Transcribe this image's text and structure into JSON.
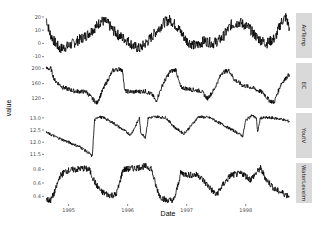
{
  "chart_data": {
    "type": "line",
    "title": "",
    "xlabel": "Date",
    "ylabel": "value",
    "x_range": [
      1994.6,
      1998.75
    ],
    "x_ticks": [
      {
        "value": 1995,
        "label": "1995"
      },
      {
        "value": 1996,
        "label": "1996"
      },
      {
        "value": 1997,
        "label": "1997"
      },
      {
        "value": 1998,
        "label": "1998"
      }
    ],
    "grid": false,
    "facets": [
      {
        "name": "AirTemp",
        "strip_label": "AirTemp",
        "ylim": [
          -11,
          23
        ],
        "y_ticks": [
          {
            "value": 20,
            "label": "20"
          },
          {
            "value": 10,
            "label": "10"
          },
          {
            "value": 0,
            "label": "0"
          },
          {
            "value": -10,
            "label": "-10"
          }
        ],
        "noise": 4,
        "points": [
          [
            1994.62,
            19
          ],
          [
            1994.68,
            8
          ],
          [
            1994.75,
            2
          ],
          [
            1994.85,
            -4
          ],
          [
            1995.0,
            -2
          ],
          [
            1995.15,
            2
          ],
          [
            1995.3,
            6
          ],
          [
            1995.45,
            12
          ],
          [
            1995.55,
            17
          ],
          [
            1995.65,
            16
          ],
          [
            1995.75,
            10
          ],
          [
            1995.85,
            6
          ],
          [
            1996.0,
            2
          ],
          [
            1996.1,
            -2
          ],
          [
            1996.2,
            -4
          ],
          [
            1996.35,
            2
          ],
          [
            1996.5,
            10
          ],
          [
            1996.62,
            16
          ],
          [
            1996.72,
            18
          ],
          [
            1996.85,
            12
          ],
          [
            1997.0,
            2
          ],
          [
            1997.15,
            -2
          ],
          [
            1997.3,
            2
          ],
          [
            1997.45,
            0
          ],
          [
            1997.6,
            4
          ],
          [
            1997.75,
            14
          ],
          [
            1997.9,
            16
          ],
          [
            1998.05,
            12
          ],
          [
            1998.2,
            4
          ],
          [
            1998.35,
            0
          ],
          [
            1998.5,
            4
          ],
          [
            1998.6,
            16
          ],
          [
            1998.68,
            20
          ],
          [
            1998.74,
            12
          ]
        ]
      },
      {
        "name": "EC",
        "strip_label": "EC",
        "ylim": [
          95,
          215
        ],
        "y_ticks": [
          {
            "value": 200,
            "label": "200"
          },
          {
            "value": 160,
            "label": "160"
          },
          {
            "value": 120,
            "label": "120"
          }
        ],
        "noise": 6,
        "points": [
          [
            1994.62,
            200
          ],
          [
            1994.7,
            200
          ],
          [
            1994.76,
            170
          ],
          [
            1994.9,
            150
          ],
          [
            1995.1,
            140
          ],
          [
            1995.3,
            138
          ],
          [
            1995.4,
            120
          ],
          [
            1995.48,
            108
          ],
          [
            1995.6,
            150
          ],
          [
            1995.75,
            195
          ],
          [
            1995.88,
            200
          ],
          [
            1995.92,
            190
          ],
          [
            1995.95,
            140
          ],
          [
            1996.1,
            138
          ],
          [
            1996.3,
            140
          ],
          [
            1996.42,
            130
          ],
          [
            1996.48,
            112
          ],
          [
            1996.6,
            160
          ],
          [
            1996.72,
            192
          ],
          [
            1996.82,
            198
          ],
          [
            1996.85,
            175
          ],
          [
            1996.9,
            150
          ],
          [
            1997.05,
            145
          ],
          [
            1997.25,
            140
          ],
          [
            1997.35,
            120
          ],
          [
            1997.45,
            140
          ],
          [
            1997.6,
            190
          ],
          [
            1997.72,
            195
          ],
          [
            1997.8,
            172
          ],
          [
            1997.95,
            155
          ],
          [
            1998.1,
            150
          ],
          [
            1998.3,
            135
          ],
          [
            1998.4,
            115
          ],
          [
            1998.48,
            110
          ],
          [
            1998.6,
            160
          ],
          [
            1998.74,
            185
          ]
        ]
      },
      {
        "name": "YoutV",
        "strip_label": "YoutV",
        "ylim": [
          11.35,
          13.2
        ],
        "y_ticks": [
          {
            "value": 13.0,
            "label": "13.0"
          },
          {
            "value": 12.5,
            "label": "12.5"
          },
          {
            "value": 12.0,
            "label": "12.0"
          },
          {
            "value": 11.5,
            "label": "11.5"
          }
        ],
        "noise": 0.06,
        "points": [
          [
            1994.62,
            12.4
          ],
          [
            1994.8,
            12.2
          ],
          [
            1995.0,
            12.0
          ],
          [
            1995.2,
            11.8
          ],
          [
            1995.37,
            11.5
          ],
          [
            1995.4,
            11.4
          ],
          [
            1995.44,
            12.9
          ],
          [
            1995.5,
            13.05
          ],
          [
            1995.6,
            13.0
          ],
          [
            1995.75,
            12.8
          ],
          [
            1995.9,
            12.55
          ],
          [
            1996.05,
            12.3
          ],
          [
            1996.12,
            12.6
          ],
          [
            1996.2,
            13.0
          ],
          [
            1996.22,
            12.4
          ],
          [
            1996.3,
            12.2
          ],
          [
            1996.35,
            13.0
          ],
          [
            1996.5,
            13.05
          ],
          [
            1996.65,
            13.0
          ],
          [
            1996.8,
            12.6
          ],
          [
            1996.95,
            12.35
          ],
          [
            1997.05,
            12.6
          ],
          [
            1997.2,
            13.05
          ],
          [
            1997.4,
            13.0
          ],
          [
            1997.55,
            12.8
          ],
          [
            1997.7,
            12.6
          ],
          [
            1997.85,
            12.4
          ],
          [
            1997.95,
            12.25
          ],
          [
            1998.0,
            12.9
          ],
          [
            1998.1,
            13.1
          ],
          [
            1998.18,
            13.0
          ],
          [
            1998.2,
            12.4
          ],
          [
            1998.25,
            13.0
          ],
          [
            1998.45,
            13.0
          ],
          [
            1998.6,
            12.95
          ],
          [
            1998.74,
            12.85
          ]
        ]
      },
      {
        "name": "WaterLevelm",
        "strip_label": "WaterLevelm",
        "ylim": [
          0.3,
          0.9
        ],
        "y_ticks": [
          {
            "value": 0.8,
            "label": "0.8"
          },
          {
            "value": 0.6,
            "label": "0.6"
          },
          {
            "value": 0.4,
            "label": "0.4"
          }
        ],
        "noise": 0.05,
        "points": [
          [
            1994.62,
            0.35
          ],
          [
            1994.7,
            0.34
          ],
          [
            1994.78,
            0.5
          ],
          [
            1994.85,
            0.7
          ],
          [
            1994.95,
            0.78
          ],
          [
            1995.1,
            0.8
          ],
          [
            1995.25,
            0.82
          ],
          [
            1995.35,
            0.8
          ],
          [
            1995.45,
            0.6
          ],
          [
            1995.55,
            0.47
          ],
          [
            1995.68,
            0.42
          ],
          [
            1995.8,
            0.42
          ],
          [
            1995.85,
            0.55
          ],
          [
            1995.92,
            0.8
          ],
          [
            1996.1,
            0.82
          ],
          [
            1996.3,
            0.85
          ],
          [
            1996.4,
            0.82
          ],
          [
            1996.48,
            0.55
          ],
          [
            1996.55,
            0.4
          ],
          [
            1996.65,
            0.34
          ],
          [
            1996.78,
            0.34
          ],
          [
            1996.82,
            0.45
          ],
          [
            1996.9,
            0.75
          ],
          [
            1997.05,
            0.72
          ],
          [
            1997.2,
            0.72
          ],
          [
            1997.3,
            0.62
          ],
          [
            1997.42,
            0.5
          ],
          [
            1997.5,
            0.42
          ],
          [
            1997.62,
            0.58
          ],
          [
            1997.75,
            0.72
          ],
          [
            1997.95,
            0.74
          ],
          [
            1998.08,
            0.65
          ],
          [
            1998.15,
            0.72
          ],
          [
            1998.25,
            0.82
          ],
          [
            1998.35,
            0.65
          ],
          [
            1998.5,
            0.5
          ],
          [
            1998.65,
            0.44
          ],
          [
            1998.74,
            0.4
          ]
        ]
      }
    ]
  }
}
